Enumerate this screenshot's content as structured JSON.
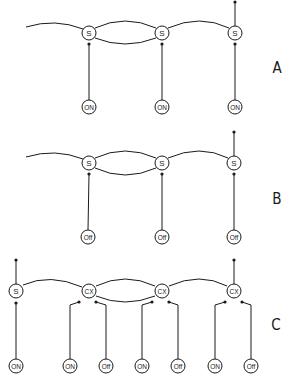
{
  "diagram": {
    "panels": [
      {
        "label": "A",
        "label_pos": [
          277,
          68
        ],
        "top_nodes": [
          {
            "text": "S",
            "x": 89,
            "y": 33
          },
          {
            "text": "S",
            "x": 162,
            "y": 33
          },
          {
            "text": "S",
            "x": 235,
            "y": 33
          }
        ],
        "bottom_nodes": [
          {
            "text": "ON",
            "x": 89,
            "y": 107,
            "parent": 0
          },
          {
            "text": "ON",
            "x": 162,
            "y": 107,
            "parent": 1
          },
          {
            "text": "ON",
            "x": 235,
            "y": 107,
            "parent": 2
          }
        ],
        "top_terminal": {
          "x": 235,
          "y": 2
        }
      },
      {
        "label": "B",
        "label_pos": [
          277,
          199
        ],
        "top_nodes": [
          {
            "text": "S",
            "x": 89,
            "y": 163
          },
          {
            "text": "S",
            "x": 162,
            "y": 163
          },
          {
            "text": "S",
            "x": 234,
            "y": 163
          }
        ],
        "bottom_nodes": [
          {
            "text": "Off",
            "x": 88,
            "y": 237,
            "parent": 0
          },
          {
            "text": "Off",
            "x": 162,
            "y": 237,
            "parent": 1
          },
          {
            "text": "Off",
            "x": 234,
            "y": 237,
            "parent": 2
          }
        ],
        "top_terminal": {
          "x": 234,
          "y": 132
        }
      },
      {
        "label": "C",
        "label_pos": [
          276,
          325
        ],
        "top_nodes": [
          {
            "text": "S",
            "x": 16,
            "y": 291
          },
          {
            "text": "CX",
            "x": 89,
            "y": 291
          },
          {
            "text": "CX",
            "x": 162,
            "y": 291
          },
          {
            "text": "CX",
            "x": 234,
            "y": 291
          }
        ],
        "bottom_nodes": [
          {
            "text": "ON",
            "x": 16,
            "y": 366,
            "parent": 0
          },
          {
            "text": "ON",
            "x": 70,
            "y": 366,
            "parent": 1
          },
          {
            "text": "Off",
            "x": 106,
            "y": 366,
            "parent": 1
          },
          {
            "text": "ON",
            "x": 142,
            "y": 366,
            "parent": 2
          },
          {
            "text": "Off",
            "x": 178,
            "y": 366,
            "parent": 2
          },
          {
            "text": "ON",
            "x": 215,
            "y": 366,
            "parent": 3
          },
          {
            "text": "Off",
            "x": 251,
            "y": 366,
            "parent": 3
          }
        ],
        "top_terminals": [
          {
            "x": 16,
            "y": 260
          },
          {
            "x": 234,
            "y": 260
          }
        ]
      }
    ]
  }
}
